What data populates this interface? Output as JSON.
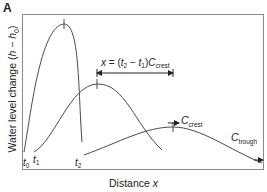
{
  "panel_label": "A",
  "axes": {
    "y_label_prefix": "Water level change (",
    "y_label_h": "h",
    "y_label_minus": " − ",
    "y_label_h0": "h",
    "y_label_sub": "0",
    "y_label_suffix": ")",
    "x_label_prefix": "Distance ",
    "x_label_var": "x"
  },
  "time_labels": [
    {
      "base": "t",
      "sub": "0"
    },
    {
      "base": "t",
      "sub": "1"
    },
    {
      "base": "t",
      "sub": "2"
    }
  ],
  "equation": {
    "lhs": "x",
    "eq": " = (",
    "t2": "t",
    "t2_sub": "2",
    "minus": " − ",
    "t1": "t",
    "t1_sub": "1",
    "close": ")",
    "c": "C",
    "c_sub": "crest"
  },
  "speed_labels": {
    "crest": {
      "base": "C",
      "sub": "crest"
    },
    "trough": {
      "base": "C",
      "sub": "trough"
    }
  },
  "colors": {
    "line": "#4a4a4a",
    "frame": "#8a8a8a",
    "text": "#222222"
  }
}
